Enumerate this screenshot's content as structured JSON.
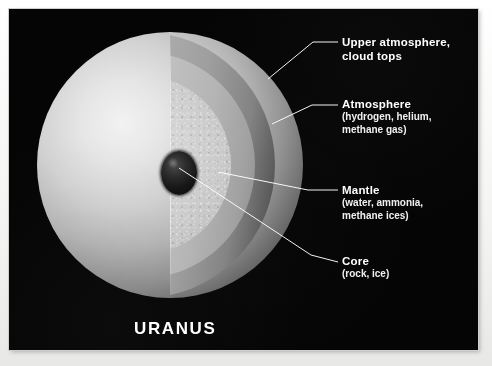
{
  "figure": {
    "title": "URANUS",
    "background_color": "#050505",
    "text_color": "#ffffff",
    "paper_color": "#f2f2f0"
  },
  "labels": [
    {
      "id": "upper-atmosphere",
      "title": "Upper atmosphere,",
      "title_line2": "cloud tops",
      "detail": ""
    },
    {
      "id": "atmosphere",
      "title": "Atmosphere",
      "detail_line1": "(hydrogen, helium,",
      "detail_line2": "methane gas)"
    },
    {
      "id": "mantle",
      "title": "Mantle",
      "detail_line1": "(water, ammonia,",
      "detail_line2": "methane ices)"
    },
    {
      "id": "core",
      "title": "Core",
      "detail_line1": "(rock, ice)"
    }
  ],
  "layers": [
    {
      "name": "upper-atmosphere-shell",
      "tone": "#bdbdbd"
    },
    {
      "name": "atmosphere-shell",
      "tone": "#cdcdcd"
    },
    {
      "name": "mantle-body",
      "tone": "#d4d4d4"
    },
    {
      "name": "core-body",
      "tone": "#141414"
    },
    {
      "name": "sphere-exterior",
      "tone": "#e6e6e6"
    }
  ]
}
